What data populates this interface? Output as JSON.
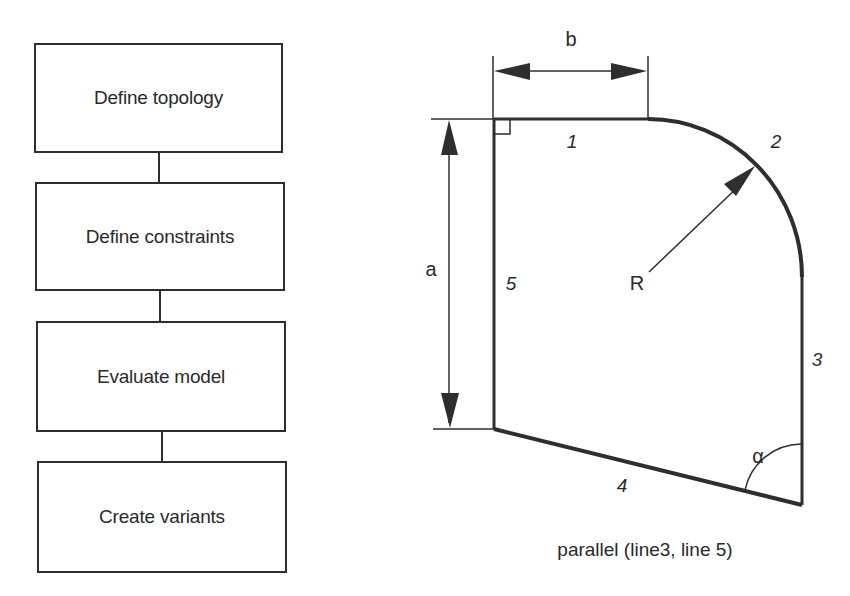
{
  "flowchart": {
    "steps": [
      {
        "label": "Define topology"
      },
      {
        "label": "Define constraints"
      },
      {
        "label": "Evaluate model"
      },
      {
        "label": "Create variants"
      }
    ]
  },
  "geometry_diagram": {
    "dimensions": {
      "width_label": "b",
      "height_label": "a",
      "radius_label": "R",
      "angle_label": "α"
    },
    "edge_labels": {
      "line1": "1",
      "line2": "2",
      "line3": "3",
      "line4": "4",
      "line5": "5"
    },
    "constraint_caption": "parallel (line3, line 5)",
    "right_angle_marker": "line1 ⟂ line5"
  },
  "colors": {
    "stroke": "#2e2e2e",
    "text": "#2a2a2a",
    "background": "#ffffff"
  }
}
